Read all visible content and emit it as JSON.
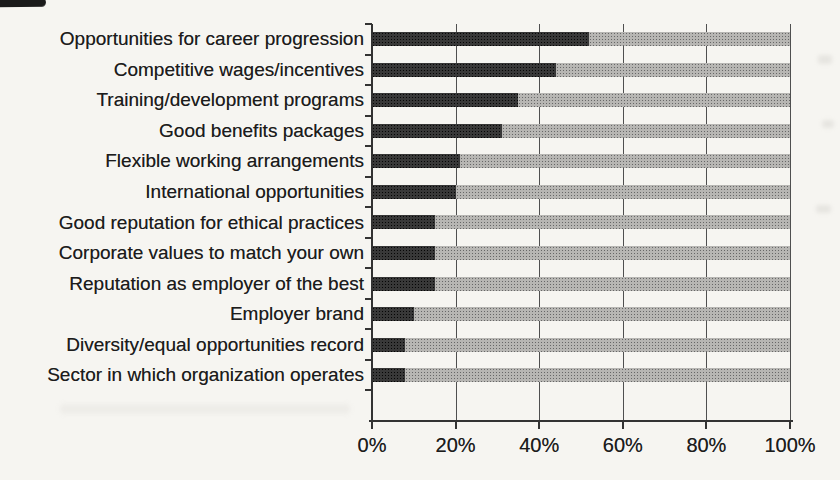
{
  "chart_data": {
    "type": "bar",
    "orientation": "horizontal",
    "stacked": true,
    "title": "",
    "xlabel": "",
    "ylabel": "",
    "categories": [
      "Opportunities for career progression",
      "Competitive wages/incentives",
      "Training/development programs",
      "Good benefits packages",
      "Flexible working arrangements",
      "International opportunities",
      "Good reputation for ethical practices",
      "Corporate values to match your own",
      "Reputation as employer of the best",
      "Employer brand",
      "Diversity/equal opportunities record",
      "Sector in which organization operates"
    ],
    "series": [
      {
        "name": "selected",
        "color": "#383838",
        "values": [
          52,
          44,
          35,
          31,
          21,
          20,
          15,
          15,
          15,
          10,
          8,
          8
        ]
      },
      {
        "name": "remainder",
        "color": "#b7b6b3",
        "values": [
          48,
          56,
          65,
          69,
          79,
          80,
          85,
          85,
          85,
          90,
          92,
          92
        ]
      }
    ],
    "xlim": [
      0,
      100
    ],
    "x_tick_values": [
      0,
      20,
      40,
      60,
      80,
      100
    ],
    "x_tick_labels": [
      "0%",
      "20%",
      "40%",
      "60%",
      "80%",
      "100%"
    ],
    "grid": "vertical",
    "legend_position": "none",
    "empty_bottom_rows": 1
  },
  "colors": {
    "background": "#f6f5f1",
    "bar_dark": "#383838",
    "bar_gray": "#b7b6b3",
    "gridline": "#4f4f4f",
    "axis": "#333333",
    "text": "#1c1c1c"
  }
}
